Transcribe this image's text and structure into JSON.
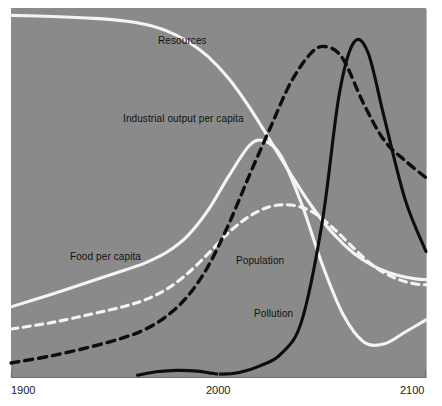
{
  "chart_data": {
    "type": "line",
    "title": "",
    "subtitle": "",
    "xlabel": "",
    "ylabel": "",
    "xlim": [
      1900,
      2100
    ],
    "ylim": [
      0,
      1
    ],
    "grid": false,
    "legend_position": "inline-labels",
    "background_color": "#8a8a8a",
    "x_ticks": [
      {
        "value": 1900,
        "label": "1900"
      },
      {
        "value": 2000,
        "label": "2000"
      },
      {
        "value": 2100,
        "label": "2100"
      }
    ],
    "y_ticks": [],
    "series": [
      {
        "name": "Resources",
        "label": "Resources",
        "color": "#f4f4f4",
        "style": "solid",
        "x": [
          1900,
          1920,
          1940,
          1955,
          1965,
          1975,
          1985,
          1995,
          2005,
          2015,
          2025,
          2035,
          2045,
          2055,
          2065,
          2075,
          2085,
          2095,
          2100
        ],
        "values": [
          0.98,
          0.977,
          0.972,
          0.965,
          0.955,
          0.938,
          0.91,
          0.868,
          0.808,
          0.73,
          0.64,
          0.548,
          0.462,
          0.39,
          0.336,
          0.3,
          0.278,
          0.266,
          0.264
        ]
      },
      {
        "name": "Industrial output per capita",
        "label": "Industrial output per capita",
        "color": "#0d0d0d",
        "style": "dashed",
        "x": [
          1900,
          1920,
          1940,
          1955,
          1965,
          1975,
          1985,
          1995,
          2005,
          2015,
          2025,
          2035,
          2045,
          2052,
          2060,
          2070,
          2080,
          2090,
          2100
        ],
        "values": [
          0.038,
          0.058,
          0.084,
          0.108,
          0.13,
          0.165,
          0.218,
          0.3,
          0.415,
          0.548,
          0.676,
          0.8,
          0.88,
          0.895,
          0.862,
          0.74,
          0.64,
          0.586,
          0.54
        ]
      },
      {
        "name": "Food per capita",
        "label": "Food per capita",
        "color": "#f4f4f4",
        "style": "solid",
        "x": [
          1900,
          1920,
          1940,
          1955,
          1965,
          1975,
          1985,
          1995,
          2005,
          2015,
          2022,
          2030,
          2040,
          2050,
          2060,
          2070,
          2080,
          2090,
          2100
        ],
        "values": [
          0.19,
          0.225,
          0.262,
          0.29,
          0.31,
          0.338,
          0.382,
          0.452,
          0.545,
          0.628,
          0.64,
          0.6,
          0.47,
          0.305,
          0.17,
          0.095,
          0.09,
          0.122,
          0.155
        ]
      },
      {
        "name": "Population",
        "label": "Population",
        "color": "#f4f4f4",
        "style": "dashed",
        "x": [
          1900,
          1920,
          1940,
          1955,
          1965,
          1975,
          1985,
          1995,
          2005,
          2015,
          2025,
          2035,
          2045,
          2055,
          2065,
          2075,
          2085,
          2095,
          2100
        ],
        "values": [
          0.13,
          0.148,
          0.172,
          0.192,
          0.21,
          0.238,
          0.28,
          0.334,
          0.392,
          0.436,
          0.462,
          0.466,
          0.448,
          0.405,
          0.35,
          0.3,
          0.268,
          0.252,
          0.25
        ]
      },
      {
        "name": "Pollution",
        "label": "Pollution",
        "color": "#0d0d0d",
        "style": "solid",
        "x": [
          1961,
          1970,
          1980,
          1990,
          2000,
          2010,
          2020,
          2030,
          2040,
          2050,
          2058,
          2065,
          2072,
          2080,
          2090,
          2100
        ],
        "values": [
          0.005,
          0.014,
          0.018,
          0.016,
          0.008,
          0.012,
          0.03,
          0.062,
          0.15,
          0.42,
          0.76,
          0.905,
          0.88,
          0.7,
          0.48,
          0.34
        ]
      }
    ],
    "annotations": [
      {
        "text": "Resources",
        "x": 1976,
        "y": 0.9
      },
      {
        "text": "Industrial output per capita",
        "x": 1958,
        "y": 0.69
      },
      {
        "text": "Food per capita",
        "x": 1930,
        "y": 0.31
      },
      {
        "text": "Population",
        "x": 2010,
        "y": 0.3
      },
      {
        "text": "Pollution",
        "x": 2019,
        "y": 0.17
      }
    ]
  },
  "axis": {
    "x_tick_1900": "1900",
    "x_tick_2000": "2000",
    "x_tick_2100": "2100"
  },
  "labels": {
    "resources": "Resources",
    "industrial_output": "Industrial output per capita",
    "food_per_capita": "Food per capita",
    "population": "Population",
    "pollution": "Pollution"
  },
  "colors": {
    "plot_background": "#8a8a8a",
    "light_series": "#f4f4f4",
    "dark_series": "#0d0d0d",
    "axis": "#6e6e6e",
    "page_background": "#ffffff"
  }
}
